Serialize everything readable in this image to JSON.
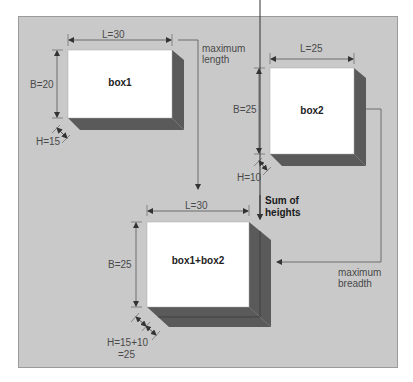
{
  "colors": {
    "background": "#ffffff",
    "panel": "#c9c9c9",
    "box_face": "#ffffff",
    "box_depth": "#5a5a5a",
    "lines": "#555555"
  },
  "boxes": [
    {
      "name": "box1",
      "length_label": "L=30",
      "breadth_label": "B=20",
      "height_label": "H=15"
    },
    {
      "name": "box2",
      "length_label": "L=25",
      "breadth_label": "B=25",
      "height_label": "H=10"
    },
    {
      "name": "box1+box2",
      "length_label": "L=30",
      "breadth_label": "B=25",
      "height_label_line1": "H=15+10",
      "height_label_line2": "=25"
    }
  ],
  "annotations": {
    "max_length_line1": "maximum",
    "max_length_line2": "length",
    "max_breadth_line1": "maximum",
    "max_breadth_line2": "breadth",
    "sum_heights_line1": "Sum of",
    "sum_heights_line2": "heights"
  }
}
